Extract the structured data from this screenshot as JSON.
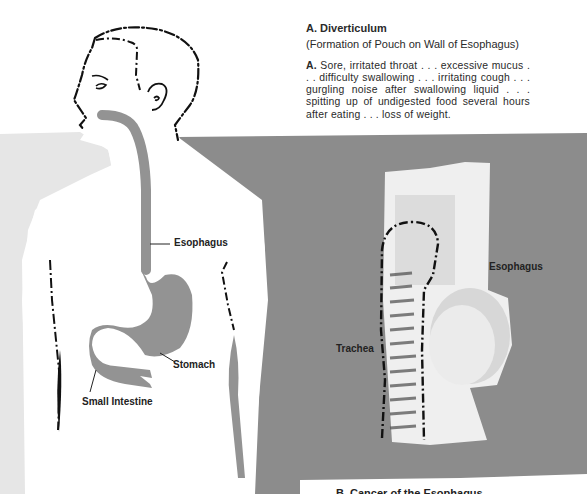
{
  "section_a": {
    "heading": "A. Diverticulum",
    "subheading": "(Formation of Pouch on Wall of Esophagus)",
    "body_lead": "A.",
    "body": " Sore, irritated throat . . . excessive mucus . . . difficulty swallowing . . . irritating cough . . . gurgling noise after swallowing liquid . . . spitting up of undigested food several hours after eating . . . loss of weight."
  },
  "figure_left": {
    "labels": {
      "esophagus": "Esophagus",
      "stomach": "Stomach",
      "small_intestine": "Small Intestine"
    }
  },
  "figure_right": {
    "labels": {
      "esophagus": "Esophagus",
      "trachea": "Trachea"
    }
  },
  "section_b": {
    "heading": "B. Cancer of the Esophagus"
  },
  "colors": {
    "light_gray_bg": "#e6e6e6",
    "dark_gray_bg": "#8c8c8c",
    "organ_gray": "#939393",
    "line_black": "#111111"
  }
}
